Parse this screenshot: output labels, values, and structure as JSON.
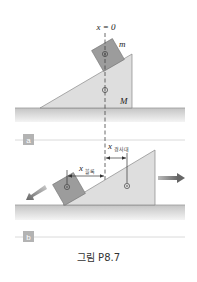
{
  "figure": {
    "caption": "그림 P8.7",
    "colors": {
      "incline": "#dcdcdc",
      "block": "#9a9a9a",
      "ground_top": "#c8c8c8",
      "ground_bottom": "#f2f2f2",
      "separator": "#cfcfcf",
      "badge": "#b0b0b0",
      "arrow": "#777777"
    },
    "panel_a": {
      "badge": "a",
      "axis_label": "x = 0",
      "block_label": "m",
      "incline_label": "M"
    },
    "panel_b": {
      "badge": "b",
      "block_disp_label": "x",
      "block_disp_sub": "블록",
      "incline_disp_label": "x",
      "incline_disp_sub": "경사대"
    }
  }
}
